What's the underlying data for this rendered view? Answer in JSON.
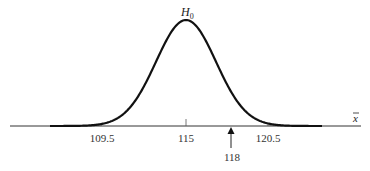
{
  "chart_data": {
    "type": "line",
    "title": "",
    "curve_label": "H",
    "curve_label_sub": "0",
    "xlabel": "x̄",
    "xlabel_base": "x",
    "ylabel": "",
    "distribution": "normal",
    "mean": 115,
    "tick_labels": [
      "109.5",
      "115",
      "120.5"
    ],
    "tick_values": [
      109.5,
      115,
      120.5
    ],
    "shaded_regions": [
      {
        "name": "lower-tail",
        "from": null,
        "to": 109.5
      },
      {
        "name": "upper-tail",
        "from": 120.5,
        "to": null
      }
    ],
    "annotation": {
      "label": "118",
      "value": 118,
      "marker": "up-arrow"
    },
    "grid": false,
    "legend": null
  },
  "labels": {
    "tick_0": "109.5",
    "tick_1": "115",
    "tick_2": "120.5",
    "arrow_value": "118",
    "h_main": "H",
    "h_sub": "0",
    "x_axis": "x"
  },
  "colors": {
    "curve": "#111111",
    "axis": "#333333",
    "shade": "#c8c8c8",
    "text": "#333333"
  }
}
